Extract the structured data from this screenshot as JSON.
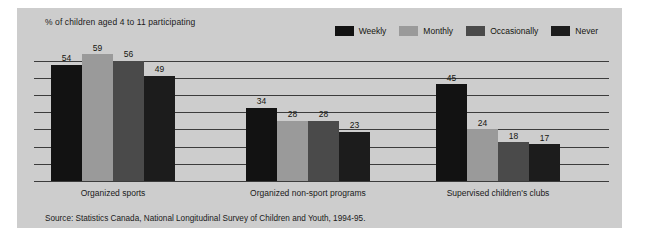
{
  "subtitle": "% of children aged 4 to 11 participating",
  "source_note": "Source: Statistics Canada, National Longitudinal Survey of Children and Youth, 1994-95.",
  "colors": {
    "panel_background": "#cdcdcd",
    "axis": "#3c3c3c",
    "text": "#15150f",
    "weekly": "#121212",
    "monthly": "#9a9a9a",
    "occasionally": "#4a4a4a",
    "never": "#1c1c1c"
  },
  "legend": {
    "position": "top-right",
    "items": [
      {
        "label": "Weekly",
        "color": "#121212"
      },
      {
        "label": "Monthly",
        "color": "#9a9a9a"
      },
      {
        "label": "Occasionally",
        "color": "#4a4a4a"
      },
      {
        "label": "Never",
        "color": "#1c1c1c"
      }
    ]
  },
  "chart_data": {
    "type": "bar",
    "title": "",
    "subtitle": "% of children aged 4 to 11 participating",
    "xlabel": "",
    "ylabel": "% of children aged 4 to 11 participating",
    "ylim": [
      0,
      60
    ],
    "grid": true,
    "gridlines": [
      8,
      16,
      24,
      32,
      40,
      48,
      56
    ],
    "categories": [
      "Organized sports",
      "Organized non-sport programs",
      "Supervised children's clubs"
    ],
    "series": [
      {
        "name": "Weekly",
        "color": "#121212",
        "values": [
          54,
          34,
          45
        ]
      },
      {
        "name": "Monthly",
        "color": "#9a9a9a",
        "values": [
          59,
          28,
          24
        ]
      },
      {
        "name": "Occasionally",
        "color": "#4a4a4a",
        "values": [
          56,
          28,
          18
        ]
      },
      {
        "name": "Never",
        "color": "#1c1c1c",
        "values": [
          49,
          23,
          17
        ]
      }
    ],
    "annotations": [
      "Source: Statistics Canada, National Longitudinal Survey of Children and Youth, 1994-95."
    ]
  }
}
